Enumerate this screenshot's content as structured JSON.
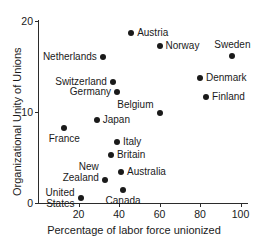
{
  "chart_data": {
    "type": "scatter",
    "title": "",
    "xlabel": "Percentage of labor force unionized",
    "ylabel": "Organizational Unity of Unions",
    "xlim": [
      0,
      105
    ],
    "ylim": [
      0,
      20
    ],
    "xticks": [
      20,
      40,
      60,
      80,
      100
    ],
    "yticks": [
      0,
      10,
      20
    ],
    "grid": false,
    "legend": "none",
    "point_label_position": "adjacent to each marker",
    "points": [
      {
        "label": "Austria",
        "x": 46,
        "y": 18.7,
        "label_pos": "right"
      },
      {
        "label": "Norway",
        "x": 60,
        "y": 17.3,
        "label_pos": "right"
      },
      {
        "label": "Sweden",
        "x": 96,
        "y": 16.2,
        "label_pos": "above"
      },
      {
        "label": "Netherlands",
        "x": 32,
        "y": 16.0,
        "label_pos": "left"
      },
      {
        "label": "Denmark",
        "x": 80,
        "y": 13.7,
        "label_pos": "right"
      },
      {
        "label": "Switzerland",
        "x": 37,
        "y": 13.3,
        "label_pos": "left"
      },
      {
        "label": "Germany",
        "x": 39,
        "y": 12.2,
        "label_pos": "left"
      },
      {
        "label": "Finland",
        "x": 83,
        "y": 11.6,
        "label_pos": "right"
      },
      {
        "label": "Belgium",
        "x": 60,
        "y": 9.9,
        "label_pos": "left-above"
      },
      {
        "label": "Japan",
        "x": 29,
        "y": 9.1,
        "label_pos": "right"
      },
      {
        "label": "France",
        "x": 13,
        "y": 8.2,
        "label_pos": "below"
      },
      {
        "label": "Italy",
        "x": 39,
        "y": 6.7,
        "label_pos": "right"
      },
      {
        "label": "Britain",
        "x": 36,
        "y": 5.3,
        "label_pos": "right"
      },
      {
        "label": "Australia",
        "x": 41,
        "y": 3.4,
        "label_pos": "right"
      },
      {
        "label": "New\nZealand",
        "x": 33,
        "y": 2.5,
        "label_pos": "left-above"
      },
      {
        "label": "Canada",
        "x": 42,
        "y": 1.4,
        "label_pos": "below"
      },
      {
        "label": "United\nStates",
        "x": 21,
        "y": 0.5,
        "label_pos": "left"
      }
    ],
    "colors": {
      "marker": "#1a1a1a",
      "axis": "#2b2b2b",
      "text": "#1a1a1a",
      "background": "#ffffff"
    }
  }
}
